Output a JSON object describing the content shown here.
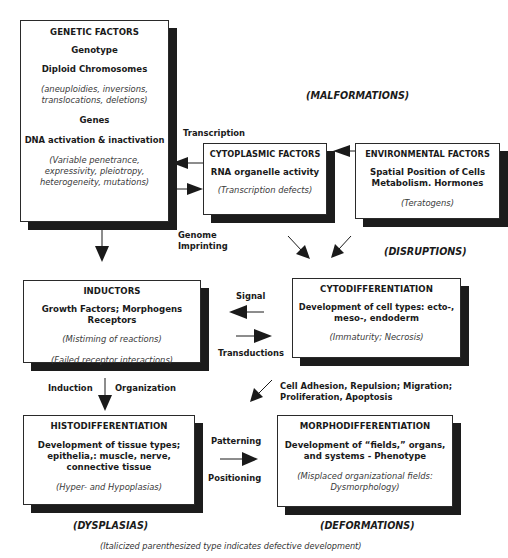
{
  "diagram": {
    "categories": {
      "malformations": "(MALFORMATIONS)",
      "disruptions": "(DISRUPTIONS)",
      "dysplasias": "(DYSPLASIAS)",
      "deformations": "(DEFORMATIONS)"
    },
    "footnote": "(Italicized parenthesized type indicates defective development)",
    "boxes": {
      "genetic": {
        "title": "GENETIC FACTORS",
        "line1": "Genotype",
        "line2": "Diploid Chromosomes",
        "defect1a": "(aneuploidies, inversions,",
        "defect1b": "translocations, deletions)",
        "line3": "Genes",
        "line4": "DNA activation & inactivation",
        "defect2a": "(Variable penetrance,",
        "defect2b": "expressivity, pleiotropy,",
        "defect2c": "heterogeneity, mutations)"
      },
      "cytoplasmic": {
        "title": "CYTOPLASMIC FACTORS",
        "line1": "RNA organelle activity",
        "defect": "(Transcription defects)"
      },
      "environmental": {
        "title": "ENVIRONMENTAL FACTORS",
        "line1": "Spatial Position of Cells",
        "line2": "Metabolism.  Hormones",
        "defect": "(Teratogens)"
      },
      "inductors": {
        "title": "INDUCTORS",
        "line1": "Growth Factors; Morphogens",
        "line2": "Receptors",
        "defect1": "(Mistiming of reactions)",
        "defect2": "(Failed receptor interactions)"
      },
      "cytodifferentiation": {
        "title": "CYTODIFFERENTIATION",
        "line1": "Development of cell types:  ecto-,",
        "line2": "meso-, endoderm",
        "defect": "(Immaturity; Necrosis)"
      },
      "histodifferentiation": {
        "title": "HISTODIFFERENTIATION",
        "line1": "Development of tissue types;",
        "line2": "epithelia,: muscle, nerve,",
        "line3": "connective tissue",
        "defect": "(Hyper- and Hypoplasias)"
      },
      "morphodifferentiation": {
        "title": "MORPHODIFFERENTIATION",
        "line1": "Development of “fields,” organs,",
        "line2": "and systems - Phenotype",
        "defect1": "(Misplaced organizational fields:",
        "defect2": "Dysmorphology)"
      }
    },
    "labels": {
      "transcription": "Transcription",
      "genome": "Genome",
      "imprinting": "Imprinting",
      "signal": "Signal",
      "transductions": "Transductions",
      "induction": "Induction",
      "organization": "Organization",
      "cell_adhesion": "Cell Adhesion, Repulsion; Migration;",
      "proliferation": "Proliferation, Apoptosis",
      "patterning": "Patterning",
      "positioning": "Positioning"
    },
    "colors": {
      "line": "#1a1a1a",
      "shadow": "#1c1c1c",
      "background": "#ffffff"
    }
  }
}
